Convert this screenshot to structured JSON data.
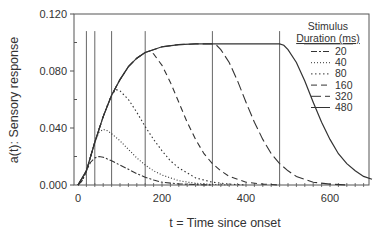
{
  "chart_data": {
    "type": "line",
    "title": "",
    "xlabel": "t = Time since onset",
    "ylabel": "a(t): Sensory response",
    "xlim": [
      0,
      700
    ],
    "ylim": [
      0,
      0.12
    ],
    "x_ticks": [
      0,
      200,
      400,
      600
    ],
    "x_tick_labels": [
      "0",
      "200",
      "400",
      "600"
    ],
    "y_ticks": [
      0,
      0.04,
      0.08,
      0.12
    ],
    "y_tick_labels": [
      "0.000",
      "0.040",
      "0.080",
      "0.120"
    ],
    "grid": false,
    "legend": {
      "title_line1": "Stimulus",
      "title_line2": "Duration (ms)",
      "position": "upper right",
      "entries": [
        "20",
        "40",
        "80",
        "160",
        "320",
        "480"
      ]
    },
    "stimulus_offset_markers": {
      "x": [
        20,
        40,
        80,
        160,
        320,
        480
      ],
      "height": 0.108
    },
    "series": [
      {
        "name": "20",
        "dash": "6,2,2,2",
        "x": [
          0,
          10,
          20,
          30,
          40,
          50,
          60,
          80,
          100,
          120,
          140,
          160,
          180,
          200,
          240,
          280,
          320
        ],
        "y": [
          0,
          0.003,
          0.01,
          0.016,
          0.019,
          0.02,
          0.0195,
          0.017,
          0.014,
          0.011,
          0.008,
          0.0055,
          0.0035,
          0.002,
          0.0008,
          0.0003,
          0
        ]
      },
      {
        "name": "40",
        "dash": "1,2",
        "x": [
          0,
          10,
          20,
          30,
          40,
          50,
          60,
          70,
          80,
          100,
          120,
          140,
          160,
          180,
          200,
          240,
          280,
          320,
          360
        ],
        "y": [
          0,
          0.003,
          0.01,
          0.02,
          0.03,
          0.037,
          0.039,
          0.038,
          0.036,
          0.031,
          0.025,
          0.019,
          0.014,
          0.01,
          0.007,
          0.003,
          0.0012,
          0.0004,
          0
        ]
      },
      {
        "name": "80",
        "dash": "1.5,2.5",
        "x": [
          0,
          10,
          20,
          30,
          40,
          50,
          60,
          70,
          80,
          90,
          100,
          120,
          140,
          160,
          180,
          200,
          220,
          240,
          280,
          320,
          360,
          400
        ],
        "y": [
          0,
          0.003,
          0.01,
          0.02,
          0.03,
          0.039,
          0.048,
          0.056,
          0.063,
          0.067,
          0.066,
          0.06,
          0.051,
          0.041,
          0.032,
          0.024,
          0.017,
          0.012,
          0.005,
          0.002,
          0.0006,
          0
        ]
      },
      {
        "name": "160",
        "dash": "6,4",
        "x": [
          0,
          20,
          40,
          60,
          80,
          100,
          120,
          140,
          160,
          170,
          180,
          200,
          220,
          240,
          260,
          280,
          300,
          320,
          340,
          360,
          400,
          440,
          480
        ],
        "y": [
          0,
          0.01,
          0.03,
          0.048,
          0.063,
          0.074,
          0.083,
          0.089,
          0.093,
          0.094,
          0.092,
          0.084,
          0.072,
          0.058,
          0.044,
          0.032,
          0.022,
          0.015,
          0.01,
          0.006,
          0.002,
          0.0006,
          0
        ]
      },
      {
        "name": "320",
        "dash": "10,4",
        "x": [
          0,
          20,
          40,
          60,
          80,
          100,
          120,
          140,
          160,
          200,
          240,
          280,
          320,
          330,
          340,
          360,
          380,
          400,
          420,
          440,
          460,
          480,
          500,
          520,
          560,
          600,
          640
        ],
        "y": [
          0,
          0.01,
          0.03,
          0.048,
          0.063,
          0.074,
          0.083,
          0.089,
          0.093,
          0.097,
          0.0985,
          0.099,
          0.099,
          0.098,
          0.095,
          0.086,
          0.073,
          0.058,
          0.044,
          0.032,
          0.022,
          0.015,
          0.01,
          0.006,
          0.002,
          0.0006,
          0
        ]
      },
      {
        "name": "480",
        "dash": "none",
        "x": [
          0,
          20,
          40,
          60,
          80,
          100,
          120,
          140,
          160,
          200,
          240,
          280,
          320,
          400,
          480,
          490,
          500,
          520,
          540,
          560,
          580,
          600,
          620,
          640,
          660,
          680,
          700
        ],
        "y": [
          0,
          0.01,
          0.03,
          0.048,
          0.063,
          0.074,
          0.083,
          0.089,
          0.093,
          0.097,
          0.0985,
          0.099,
          0.099,
          0.099,
          0.099,
          0.098,
          0.095,
          0.086,
          0.073,
          0.058,
          0.044,
          0.032,
          0.022,
          0.015,
          0.01,
          0.006,
          0.004
        ]
      }
    ]
  }
}
